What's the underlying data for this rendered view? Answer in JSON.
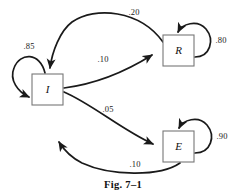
{
  "figure": {
    "caption": "Fig. 7–1",
    "stroke_color": "#1a1a1a",
    "box_stroke_color": "#777777",
    "background": "#ffffff"
  },
  "nodes": [
    {
      "id": "I",
      "label": "I",
      "x": 32,
      "y": 74,
      "w": 31,
      "h": 31
    },
    {
      "id": "R",
      "label": "R",
      "x": 163,
      "y": 35,
      "w": 31,
      "h": 31
    },
    {
      "id": "E",
      "label": "E",
      "x": 163,
      "y": 131,
      "w": 31,
      "h": 31
    }
  ],
  "edges": [
    {
      "id": "R-to-I",
      "from": "R",
      "to": "I",
      "weight": ".20",
      "label_x": 134,
      "label_y": 13
    },
    {
      "id": "I-to-R",
      "from": "I",
      "to": "R",
      "weight": ".10",
      "label_x": 103,
      "label_y": 60
    },
    {
      "id": "I-to-E",
      "from": "I",
      "to": "E",
      "weight": ".05",
      "label_x": 108,
      "label_y": 110
    },
    {
      "id": "E-to-I",
      "from": "E",
      "to": "I",
      "weight": ".10",
      "label_x": 135,
      "label_y": 165
    },
    {
      "id": "I-self",
      "from": "I",
      "to": "I",
      "weight": ".85",
      "label_x": 29,
      "label_y": 47
    },
    {
      "id": "R-self",
      "from": "R",
      "to": "R",
      "weight": ".80",
      "label_x": 221,
      "label_y": 41
    },
    {
      "id": "E-self",
      "from": "E",
      "to": "E",
      "weight": ".90",
      "label_x": 222,
      "label_y": 137
    }
  ]
}
